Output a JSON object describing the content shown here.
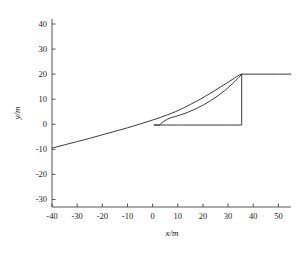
{
  "chart_data": {
    "type": "line",
    "title": "",
    "xlabel": "x/m",
    "ylabel": "y/m",
    "xlim": [
      -40,
      55
    ],
    "ylim": [
      -33,
      42
    ],
    "grid": false,
    "legend": null,
    "xticks": [
      -40,
      -30,
      -20,
      -10,
      0,
      10,
      20,
      30,
      40,
      50
    ],
    "xtick_labels": [
      "-40",
      "-30",
      "-20",
      "-10",
      "0",
      "10",
      "20",
      "30",
      "40",
      "50"
    ],
    "yticks": [
      -30,
      -20,
      -10,
      0,
      10,
      20,
      30,
      40
    ],
    "ytick_labels": [
      "-30",
      "-20",
      "-10",
      "0",
      "10",
      "20",
      "30",
      "40"
    ],
    "series": [
      {
        "name": "outbound-path",
        "color": "#3c3c3c",
        "points": [
          [
            -40,
            -9.5
          ],
          [
            -35,
            -8.2
          ],
          [
            -30,
            -6.9
          ],
          [
            -25,
            -5.6
          ],
          [
            -20,
            -4.2
          ],
          [
            -15,
            -2.8
          ],
          [
            -10,
            -1.4
          ],
          [
            -5,
            0.1
          ],
          [
            0,
            1.7
          ],
          [
            3,
            2.7
          ],
          [
            6,
            3.8
          ],
          [
            9,
            5.0
          ],
          [
            12,
            6.4
          ],
          [
            15,
            7.9
          ],
          [
            18,
            9.5
          ],
          [
            21,
            11.2
          ],
          [
            24,
            13.0
          ],
          [
            27,
            14.9
          ],
          [
            30,
            16.8
          ],
          [
            32,
            18.1
          ],
          [
            33.5,
            19.1
          ],
          [
            34.5,
            19.7
          ],
          [
            35.4,
            20.0
          ],
          [
            40,
            20.0
          ],
          [
            45,
            20.0
          ],
          [
            50,
            20.0
          ],
          [
            55,
            20.0
          ]
        ]
      },
      {
        "name": "return-path",
        "color": "#3c3c3c",
        "points": [
          [
            35.4,
            20.0
          ],
          [
            34,
            18.4
          ],
          [
            32,
            16.4
          ],
          [
            29,
            13.7
          ],
          [
            26,
            11.4
          ],
          [
            23,
            9.4
          ],
          [
            20,
            7.6
          ],
          [
            17,
            6.1
          ],
          [
            14,
            4.8
          ],
          [
            11,
            3.7
          ],
          [
            9,
            3.1
          ],
          [
            7.5,
            2.7
          ],
          [
            6,
            2.1
          ],
          [
            4.5,
            1.2
          ],
          [
            3.2,
            0.2
          ],
          [
            2.6,
            -0.3
          ],
          [
            0.5,
            -0.3
          ],
          [
            10,
            -0.3
          ],
          [
            20,
            -0.3
          ],
          [
            30,
            -0.3
          ],
          [
            35.4,
            -0.3
          ],
          [
            35.4,
            20.0
          ]
        ]
      }
    ],
    "annotations": [
      {
        "name": "plateau-level",
        "value": 20,
        "description": "upper plateau y=20"
      },
      {
        "name": "drop-x",
        "value": 35.4,
        "description": "vertical drop at x=35.4"
      },
      {
        "name": "baseline-level",
        "value": 0,
        "description": "lower horizontal run y=0"
      }
    ]
  }
}
